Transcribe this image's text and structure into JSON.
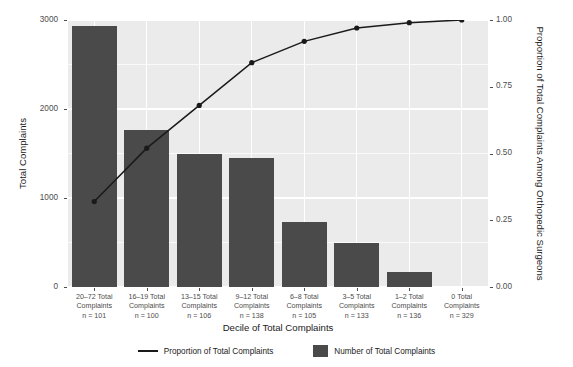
{
  "chart_data": {
    "type": "bar",
    "title": "",
    "subtitle": "",
    "xlabel": "Decile of Total Complaints",
    "ylabel": "Total Complaints",
    "y2label": "Proportion of Total Complaints Among Orthopedic Surgeons",
    "grid": true,
    "legend_position": "bottom",
    "categories": [
      "20–72 Total\nComplaints\nn = 101",
      "16–19 Total\nComplaints\nn = 100",
      "13–15 Total\nComplaints\nn = 106",
      "9–12 Total\nComplaints\nn = 138",
      "6–8 Total\nComplaints\nn = 105",
      "3–5 Total\nComplaints\nn = 133",
      "1–2 Total\nComplaints\nn = 136",
      "0 Total\nComplaints\nn = 329"
    ],
    "decile_ranges": [
      "20–72",
      "16–19",
      "13–15",
      "9–12",
      "6–8",
      "3–5",
      "1–2",
      "0"
    ],
    "decile_counts": [
      "n = 101",
      "n = 100",
      "n = 106",
      "n = 138",
      "n = 105",
      "n = 133",
      "n = 136",
      "n = 329"
    ],
    "series": [
      {
        "name": "Number of Total Complaints",
        "axis": "left",
        "render": "bar",
        "color": "#4a4a4a",
        "values": [
          2930,
          1760,
          1490,
          1450,
          730,
          490,
          170,
          0
        ]
      },
      {
        "name": "Proportion of Total Complaints",
        "axis": "right",
        "render": "line",
        "color": "#1a1a1a",
        "values": [
          0.32,
          0.52,
          0.68,
          0.84,
          0.92,
          0.97,
          0.99,
          1.0
        ]
      }
    ],
    "ylim": [
      0,
      3000
    ],
    "yticks": [
      0,
      1000,
      2000,
      3000
    ],
    "ytick_labels": [
      "0",
      "1000",
      "2000",
      "3000"
    ],
    "y2lim": [
      0,
      1.0
    ],
    "y2ticks": [
      0.0,
      0.25,
      0.5,
      0.75,
      1.0
    ],
    "y2tick_labels": [
      "0.00",
      "0.25",
      "0.50",
      "0.75",
      "1.00"
    ]
  },
  "legend": {
    "items": [
      {
        "label": "Proportion of Total Complaints",
        "marker": "line"
      },
      {
        "label": "Number of Total Complaints",
        "marker": "swatch"
      }
    ]
  },
  "colors": {
    "bar": "#4a4a4a",
    "line": "#1a1a1a",
    "panel_background": "#ebebeb",
    "gridline": "#ffffff",
    "figure_background": "#ffffff",
    "axis_text": "#4d4d4d",
    "axis_title": "#1a1a1a"
  }
}
